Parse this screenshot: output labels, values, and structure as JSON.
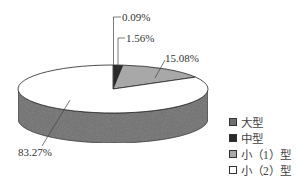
{
  "chart_data": {
    "type": "pie",
    "style": "3d",
    "title": "",
    "categories": [
      "大型",
      "中型",
      "小（1）型",
      "小（2）型"
    ],
    "values": [
      0.09,
      1.56,
      15.08,
      83.27
    ],
    "labels": [
      "0.09%",
      "1.56%",
      "15.08%",
      "83.27%"
    ],
    "colors": [
      "#6e6e6e",
      "#2a2a2a",
      "#a8a8a8",
      "#ffffff"
    ],
    "side_color": "#707070",
    "legend_position": "right-bottom"
  },
  "legend": [
    {
      "label": "大型",
      "color": "#6e6e6e"
    },
    {
      "label": "中型",
      "color": "#2a2a2a"
    },
    {
      "label": "小（1）型",
      "color": "#a8a8a8"
    },
    {
      "label": "小（2）型",
      "color": "#ffffff"
    }
  ]
}
